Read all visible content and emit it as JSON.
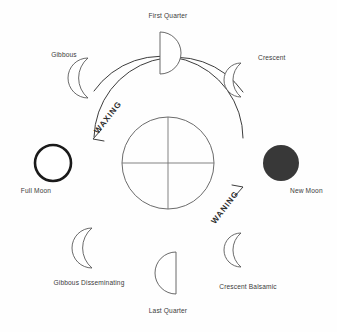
{
  "diagram": {
    "background_color": "#fefefe",
    "center": {
      "name": "earth",
      "shape": "circle-with-cross",
      "cx": 168,
      "cy": 163,
      "r": 46,
      "stroke_color": "#5a5a5a"
    },
    "flow_arrows": [
      {
        "id": "waxing",
        "label": "WAXING",
        "direction": "counterclockwise",
        "from": "new-moon-side",
        "to": "full-moon-side",
        "half": "upper-left",
        "text_rotation_deg": -52,
        "label_x": 110,
        "label_y": 119,
        "color": "#3d3d3d"
      },
      {
        "id": "waning",
        "label": "WANING",
        "direction": "counterclockwise",
        "from": "full-moon-side",
        "to": "new-moon-side",
        "half": "lower-right",
        "text_rotation_deg": -52,
        "label_x": 227,
        "label_y": 209,
        "color": "#3d3d3d"
      }
    ],
    "phases": [
      {
        "id": "first-quarter",
        "label": "First Quarter",
        "shape": "half-right",
        "position": "top",
        "shape_cx": 168,
        "shape_cy": 53,
        "shape_r": 21,
        "label_x": 168,
        "label_y": 18,
        "label_anchor": "middle",
        "fill": "#ffffff",
        "stroke": "#595959"
      },
      {
        "id": "crescent",
        "label": "Crescent",
        "shape": "crescent-right",
        "position": "top-right",
        "shape_cx": 248,
        "shape_cy": 80,
        "shape_r": 17,
        "label_x": 258,
        "label_y": 60,
        "label_anchor": "start",
        "fill": "#ffffff",
        "stroke": "#595959"
      },
      {
        "id": "new-moon",
        "label": "New Moon",
        "shape": "disc-filled",
        "position": "right",
        "shape_cx": 281,
        "shape_cy": 163,
        "shape_r": 18,
        "label_x": 290,
        "label_y": 193,
        "label_anchor": "start",
        "fill": "#383838",
        "stroke": "none"
      },
      {
        "id": "crescent-balsamic",
        "label": "Crescent Balsamic",
        "shape": "crescent-left",
        "position": "bottom-right",
        "shape_cx": 248,
        "shape_cy": 250,
        "shape_r": 17,
        "label_x": 248,
        "label_y": 289,
        "label_anchor": "middle",
        "fill": "#ffffff",
        "stroke": "#595959"
      },
      {
        "id": "last-quarter",
        "label": "Last Quarter",
        "shape": "half-left",
        "position": "bottom",
        "shape_cx": 168,
        "shape_cy": 273,
        "shape_r": 21,
        "label_x": 168,
        "label_y": 313,
        "label_anchor": "middle",
        "fill": "#ffffff",
        "stroke": "#595959"
      },
      {
        "id": "gibbous-disseminating",
        "label": "Gibbous Disseminating",
        "shape": "gibbous",
        "position": "bottom-left",
        "shape_cx": 92,
        "shape_cy": 248,
        "shape_r": 20,
        "label_x": 89,
        "label_y": 285,
        "label_anchor": "middle",
        "fill": "#ffffff",
        "stroke": "#595959"
      },
      {
        "id": "full-moon",
        "label": "Full Moon",
        "shape": "ring-thick",
        "position": "left",
        "shape_cx": 53,
        "shape_cy": 163,
        "shape_r": 19,
        "label_x": 36,
        "label_y": 193,
        "label_anchor": "middle",
        "fill": "#ffffff",
        "stroke": "#1a1a1a"
      },
      {
        "id": "gibbous",
        "label": "Gibbous",
        "shape": "gibbous",
        "position": "top-left",
        "shape_cx": 88,
        "shape_cy": 78,
        "shape_r": 20,
        "label_x": 64,
        "label_y": 57,
        "label_anchor": "middle",
        "fill": "#ffffff",
        "stroke": "#595959"
      }
    ]
  }
}
